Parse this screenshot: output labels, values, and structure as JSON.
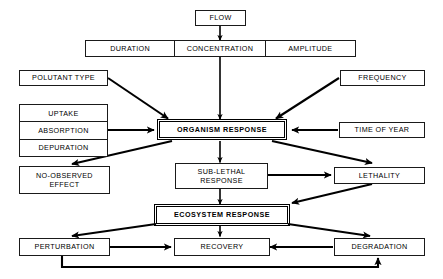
{
  "diagram": {
    "background_color": "#ffffff",
    "line_color": "#000000",
    "nodes": {
      "flow": {
        "label": "FLOW"
      },
      "exposure_row": {
        "duration": "DURATION",
        "concentration": "CONCENTRATION",
        "amplitude": "AMPLITUDE"
      },
      "polutant_type": {
        "label": "POLUTANT TYPE"
      },
      "frequency": {
        "label": "FREQUENCY"
      },
      "kinetics_stack": {
        "uptake": "UPTAKE",
        "absorption": "ABSORPTION",
        "depuration": "DEPURATION"
      },
      "organism_response": {
        "label": "ORGANISM RESPONSE"
      },
      "time_of_year": {
        "label": "TIME OF YEAR"
      },
      "no_observed_effect": {
        "label": "NO-OBSERVED\nEFFECT"
      },
      "sub_lethal_response": {
        "label": "SUB-LETHAL\nRESPONSE"
      },
      "lethality": {
        "label": "LETHALITY"
      },
      "ecosystem_response": {
        "label": "ECOSYSTEM RESPONSE"
      },
      "perturbation": {
        "label": "PERTURBATION"
      },
      "recovery": {
        "label": "RECOVERY"
      },
      "degradation": {
        "label": "DEGRADATION"
      }
    },
    "edges": [
      {
        "from": "flow",
        "to": "concentration"
      },
      {
        "from": "concentration",
        "to": "organism_response"
      },
      {
        "from": "polutant_type",
        "to": "organism_response"
      },
      {
        "from": "frequency",
        "to": "organism_response"
      },
      {
        "from": "kinetics_stack",
        "to": "organism_response"
      },
      {
        "from": "time_of_year",
        "to": "organism_response"
      },
      {
        "from": "organism_response",
        "to": "no_observed_effect"
      },
      {
        "from": "organism_response",
        "to": "sub_lethal_response"
      },
      {
        "from": "organism_response",
        "to": "lethality"
      },
      {
        "from": "sub_lethal_response",
        "to": "lethality"
      },
      {
        "from": "sub_lethal_response",
        "to": "ecosystem_response"
      },
      {
        "from": "lethality",
        "to": "ecosystem_response"
      },
      {
        "from": "ecosystem_response",
        "to": "perturbation"
      },
      {
        "from": "ecosystem_response",
        "to": "recovery"
      },
      {
        "from": "ecosystem_response",
        "to": "degradation"
      },
      {
        "from": "perturbation",
        "to": "recovery"
      },
      {
        "from": "degradation",
        "to": "recovery"
      },
      {
        "from": "perturbation",
        "to": "degradation"
      }
    ]
  }
}
